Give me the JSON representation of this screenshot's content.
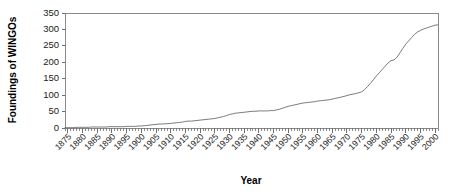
{
  "chart_data": {
    "type": "line",
    "title": "",
    "xlabel": "Year",
    "ylabel": "Foundings of WINGOs",
    "xlim": [
      1874,
      2001
    ],
    "ylim": [
      0,
      350
    ],
    "grid": false,
    "legend": false,
    "legend_position": "none",
    "line_color": "#6b6b6b",
    "axis_color": "#8a8a8a",
    "background_color": "#ffffff",
    "ytick_labels": [
      "0",
      "50",
      "100",
      "150",
      "200",
      "250",
      "300",
      "350"
    ],
    "ytick_values": [
      0,
      50,
      100,
      150,
      200,
      250,
      300,
      350
    ],
    "ytick_step": 50,
    "xtick_labels": [
      "1875",
      "1880",
      "1885",
      "1890",
      "1895",
      "1900",
      "1905",
      "1910",
      "1915",
      "1920",
      "1925",
      "1930",
      "1935",
      "1940",
      "1945",
      "1950",
      "1955",
      "1960",
      "1965",
      "1970",
      "1975",
      "1980",
      "1985",
      "1990",
      "1995",
      "2000"
    ],
    "xtick_values": [
      1875,
      1880,
      1885,
      1890,
      1895,
      1900,
      1905,
      1910,
      1915,
      1920,
      1925,
      1930,
      1935,
      1940,
      1945,
      1950,
      1955,
      1960,
      1965,
      1970,
      1975,
      1980,
      1985,
      1990,
      1995,
      2000
    ],
    "xtick_step": 5,
    "xtick_minor_step": 1,
    "xtick_label_rotation": -45,
    "x": [
      1874,
      1875,
      1876,
      1877,
      1878,
      1879,
      1880,
      1881,
      1882,
      1883,
      1884,
      1885,
      1886,
      1887,
      1888,
      1889,
      1890,
      1891,
      1892,
      1893,
      1894,
      1895,
      1896,
      1897,
      1898,
      1899,
      1900,
      1901,
      1902,
      1903,
      1904,
      1905,
      1906,
      1907,
      1908,
      1909,
      1910,
      1911,
      1912,
      1913,
      1914,
      1915,
      1916,
      1917,
      1918,
      1919,
      1920,
      1921,
      1922,
      1923,
      1924,
      1925,
      1926,
      1927,
      1928,
      1929,
      1930,
      1931,
      1932,
      1933,
      1934,
      1935,
      1936,
      1937,
      1938,
      1939,
      1940,
      1941,
      1942,
      1943,
      1944,
      1945,
      1946,
      1947,
      1948,
      1949,
      1950,
      1951,
      1952,
      1953,
      1954,
      1955,
      1956,
      1957,
      1958,
      1959,
      1960,
      1961,
      1962,
      1963,
      1964,
      1965,
      1966,
      1967,
      1968,
      1969,
      1970,
      1971,
      1972,
      1973,
      1974,
      1975,
      1976,
      1977,
      1978,
      1979,
      1980,
      1981,
      1982,
      1983,
      1984,
      1985,
      1986,
      1987,
      1988,
      1989,
      1990,
      1991,
      1992,
      1993,
      1994,
      1995,
      1996,
      1997,
      1998,
      1999,
      2000,
      2001
    ],
    "values": [
      1,
      1,
      1,
      1,
      2,
      2,
      2,
      2,
      2,
      3,
      3,
      3,
      3,
      3,
      3,
      4,
      4,
      4,
      4,
      4,
      4,
      5,
      5,
      5,
      5,
      6,
      6,
      7,
      8,
      9,
      10,
      11,
      12,
      12,
      13,
      13,
      14,
      15,
      16,
      17,
      18,
      20,
      21,
      21,
      22,
      23,
      24,
      25,
      26,
      27,
      28,
      29,
      31,
      33,
      35,
      38,
      41,
      43,
      45,
      46,
      47,
      48,
      49,
      50,
      51,
      51,
      52,
      52,
      52,
      52,
      53,
      53,
      55,
      57,
      60,
      63,
      66,
      68,
      70,
      72,
      74,
      76,
      77,
      78,
      79,
      80,
      82,
      83,
      84,
      85,
      86,
      88,
      90,
      92,
      94,
      96,
      99,
      101,
      103,
      105,
      107,
      110,
      117,
      126,
      136,
      147,
      158,
      168,
      178,
      188,
      198,
      205,
      207,
      215,
      228,
      242,
      255,
      265,
      275,
      285,
      292,
      297,
      301,
      304,
      307,
      310,
      313,
      314
    ],
    "series_name": "Cumulative foundings of WINGOs",
    "annotations": []
  },
  "axes": {
    "y_title": "Foundings of WINGOs",
    "x_title": "Year"
  }
}
